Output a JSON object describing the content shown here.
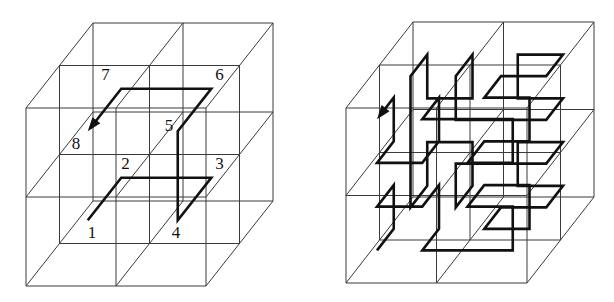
{
  "figures": [
    {
      "id": "left",
      "description": "2x2x2 cube grid with first-order 3D Hilbert curve, vertices numbered 1-8",
      "origin": [
        26,
        286
      ],
      "cell": [
        90,
        89
      ],
      "depth_offset": [
        33.5,
        -42.5
      ],
      "divisions": 2,
      "labels": [
        "1",
        "2",
        "3",
        "4",
        "5",
        "6",
        "7",
        "8"
      ],
      "path": [
        [
          0.5,
          0.5,
          0.5
        ],
        [
          0.5,
          0.5,
          1.5
        ],
        [
          1.5,
          0.5,
          1.5
        ],
        [
          1.5,
          0.5,
          0.5
        ],
        [
          1.5,
          1.5,
          0.5
        ],
        [
          1.5,
          1.5,
          1.5
        ],
        [
          0.5,
          1.5,
          1.5
        ],
        [
          0.5,
          1.5,
          0.5
        ]
      ],
      "label_offsets": [
        [
          0,
          18
        ],
        [
          0,
          -9
        ],
        [
          4,
          -9
        ],
        [
          -6,
          18
        ],
        [
          -13,
          0
        ],
        [
          4,
          -9
        ],
        [
          -20,
          -9
        ],
        [
          -16,
          18
        ]
      ],
      "arrow_end": true
    },
    {
      "id": "right",
      "description": "2x2x2 cube grid with second-order 3D Hilbert curve (64 points), arrow at end",
      "origin": [
        346,
        283
      ],
      "cell": [
        90.5,
        87.5
      ],
      "depth_offset": [
        33.5,
        -43
      ],
      "divisions": 2,
      "hilbert_order": 2,
      "arrow_end": true
    }
  ],
  "colors": {
    "grid": "#3a3a3a",
    "path": "#111111",
    "background": "#ffffff"
  }
}
